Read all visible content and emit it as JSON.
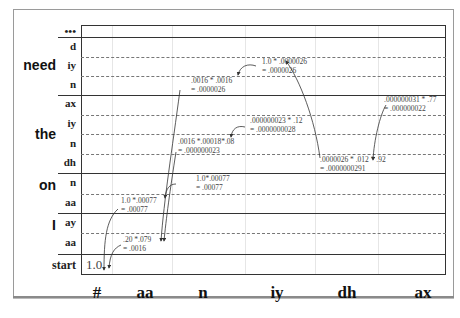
{
  "diagram": {
    "words": [
      {
        "label": "need",
        "top": 64
      },
      {
        "label": "the",
        "top": 133
      },
      {
        "label": "on",
        "top": 184
      },
      {
        "label": "I",
        "top": 225
      }
    ],
    "states": [
      {
        "label": "•••",
        "top": 27
      },
      {
        "label": "d",
        "top": 41
      },
      {
        "label": "iy",
        "top": 60
      },
      {
        "label": "n",
        "top": 80
      },
      {
        "label": "ax",
        "top": 99
      },
      {
        "label": "iy",
        "top": 119
      },
      {
        "label": "n",
        "top": 138
      },
      {
        "label": "dh",
        "top": 158
      },
      {
        "label": "n",
        "top": 177
      },
      {
        "label": "aa",
        "top": 197
      },
      {
        "label": "ay",
        "top": 217
      },
      {
        "label": "aa",
        "top": 237
      },
      {
        "label": "start",
        "top": 258
      }
    ],
    "observations": [
      {
        "label": "#",
        "x": 97
      },
      {
        "label": "aa",
        "x": 145
      },
      {
        "label": "n",
        "x": 203
      },
      {
        "label": "iy",
        "x": 277
      },
      {
        "label": "dh",
        "x": 347
      },
      {
        "label": "ax",
        "x": 423
      }
    ],
    "initial_value": "1.0",
    "annotations": [
      {
        "id": "i-aa",
        "line1": ".20 *.079",
        "line2": "= .0016",
        "x": 120,
        "y": 237
      },
      {
        "id": "on-aa",
        "line1": "1.0 *.00077",
        "line2": "= .00077",
        "x": 120,
        "y": 198
      },
      {
        "id": "on-n",
        "line1": "1.0*.00077",
        "line2": "= .00077",
        "x": 196,
        "y": 176
      },
      {
        "id": "need-n",
        "line1": ".0016 * .0016",
        "line2": "= .0000026",
        "x": 191,
        "y": 78
      },
      {
        "id": "need-iy",
        "line1": "1.0 * .0000026",
        "line2": "= .0000026",
        "x": 262,
        "y": 58
      },
      {
        "id": "the-n",
        "line1": ".0016 *.00018*.08",
        "line2": "= .000000023",
        "x": 178,
        "y": 139
      },
      {
        "id": "the-iy",
        "line1": ".000000023 * .12",
        "line2": "= .0000000028",
        "x": 250,
        "y": 118
      },
      {
        "id": "the-dh",
        "line1": ".0000026 * .012 * .92",
        "line2": "= .0000000291",
        "x": 320,
        "y": 157
      },
      {
        "id": "the-ax",
        "line1": ".000000031 * .77",
        "line2": "= .000000022",
        "x": 385,
        "y": 97
      }
    ]
  }
}
